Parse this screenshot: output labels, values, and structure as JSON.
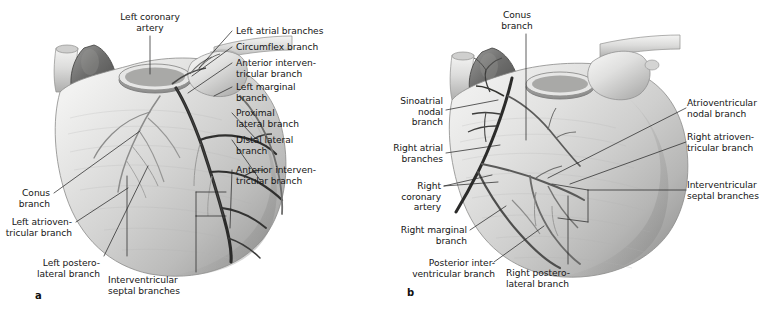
{
  "figure": {
    "type": "anatomical-illustration",
    "background_color": "#ffffff",
    "label_color": "#151515",
    "leader_line_color": "#2a2a2a",
    "panels": [
      {
        "id": "a",
        "letter": "a",
        "view": "anterior",
        "labels": [
          {
            "key": "left_coronary_artery",
            "text": "Left coronary\nartery",
            "align": "center"
          },
          {
            "key": "left_atrial_branches",
            "text": "Left atrial branches",
            "align": "left"
          },
          {
            "key": "circumflex_branch",
            "text": "Circumflex branch",
            "align": "left"
          },
          {
            "key": "anterior_interventricular_branch_top",
            "text": "Anterior interven-\ntricular branch",
            "align": "left"
          },
          {
            "key": "left_marginal_branch",
            "text": "Left marginal\nbranch",
            "align": "left"
          },
          {
            "key": "proximal_lateral_branch",
            "text": "Proximal\nlateral branch",
            "align": "left"
          },
          {
            "key": "distal_lateral_branch",
            "text": "Distal lateral\nbranch",
            "align": "left"
          },
          {
            "key": "anterior_interventricular_branch_bottom",
            "text": "Anterior interven-\ntricular branch",
            "align": "left"
          },
          {
            "key": "conus_branch",
            "text": "Conus\nbranch",
            "align": "right"
          },
          {
            "key": "left_atrioventricular_branch",
            "text": "Left atrioven-\ntricular branch",
            "align": "right"
          },
          {
            "key": "left_posterolateral_branch",
            "text": "Left postero-\nlateral branch",
            "align": "right"
          },
          {
            "key": "interventricular_septal_branches",
            "text": "Interventricular\nseptal branches",
            "align": "left"
          }
        ]
      },
      {
        "id": "b",
        "letter": "b",
        "view": "posterior",
        "labels": [
          {
            "key": "conus_branch",
            "text": "Conus\nbranch",
            "align": "center"
          },
          {
            "key": "sinoatrial_nodal_branch",
            "text": "Sinoatrial\nnodal\nbranch",
            "align": "right"
          },
          {
            "key": "right_atrial_branches",
            "text": "Right atrial\nbranches",
            "align": "right"
          },
          {
            "key": "right_coronary_artery",
            "text": "Right\ncoronary\nartery",
            "align": "right"
          },
          {
            "key": "right_marginal_branch",
            "text": "Right marginal\nbranch",
            "align": "right"
          },
          {
            "key": "posterior_interventricular_branch",
            "text": "Posterior inter-\nventricular branch",
            "align": "right"
          },
          {
            "key": "right_posterolateral_branch",
            "text": "Right postero-\nlateral branch",
            "align": "left"
          },
          {
            "key": "atrioventricular_nodal_branch",
            "text": "Atrioventricular\nnodal branch",
            "align": "left"
          },
          {
            "key": "right_atrioventricular_branch",
            "text": "Right atrioven-\ntricular branch",
            "align": "left"
          },
          {
            "key": "interventricular_septal_branches",
            "text": "Interventricular\nseptal branches",
            "align": "left"
          }
        ]
      }
    ]
  }
}
